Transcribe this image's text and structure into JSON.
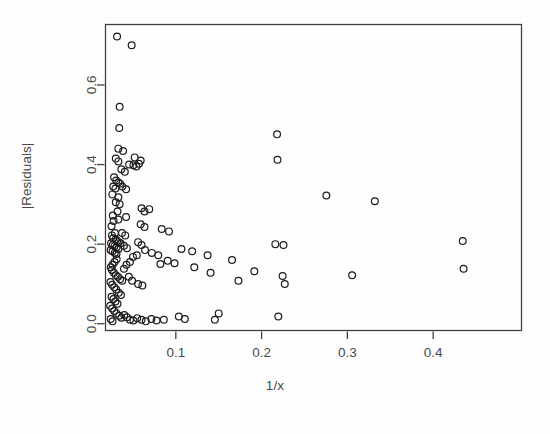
{
  "chart_data": {
    "type": "scatter",
    "title": "",
    "xlabel": "1/x",
    "ylabel": "|Residuals|",
    "xlim": [
      0.018,
      0.503
    ],
    "ylim": [
      -0.017,
      0.752
    ],
    "xticks": [
      0.1,
      0.2,
      0.3,
      0.4
    ],
    "xticklabels": [
      "0.1",
      "0.2",
      "0.3",
      "0.4"
    ],
    "yticks": [
      0.0,
      0.2,
      0.4,
      0.6
    ],
    "yticklabels": [
      "0.0",
      "0.2",
      "0.4",
      "0.6"
    ],
    "grid": false,
    "legend": null,
    "marker": {
      "shape": "open-circle",
      "radius_px": 3.4,
      "stroke": "#1c1c1c",
      "stroke_width": 1.2,
      "fill": "none"
    },
    "frame": {
      "box": true,
      "color": "#3c3c3c"
    },
    "points": [
      [
        0.0315,
        0.722
      ],
      [
        0.0485,
        0.7
      ],
      [
        0.0345,
        0.545
      ],
      [
        0.034,
        0.492
      ],
      [
        0.033,
        0.44
      ],
      [
        0.0385,
        0.434
      ],
      [
        0.03,
        0.415
      ],
      [
        0.033,
        0.408
      ],
      [
        0.052,
        0.418
      ],
      [
        0.059,
        0.41
      ],
      [
        0.0455,
        0.4
      ],
      [
        0.0505,
        0.398
      ],
      [
        0.054,
        0.395
      ],
      [
        0.057,
        0.402
      ],
      [
        0.0365,
        0.388
      ],
      [
        0.0405,
        0.382
      ],
      [
        0.028,
        0.368
      ],
      [
        0.0305,
        0.36
      ],
      [
        0.033,
        0.355
      ],
      [
        0.035,
        0.352
      ],
      [
        0.027,
        0.345
      ],
      [
        0.0295,
        0.34
      ],
      [
        0.0375,
        0.345
      ],
      [
        0.042,
        0.338
      ],
      [
        0.026,
        0.325
      ],
      [
        0.033,
        0.318
      ],
      [
        0.03,
        0.305
      ],
      [
        0.0345,
        0.3
      ],
      [
        0.032,
        0.282
      ],
      [
        0.0265,
        0.272
      ],
      [
        0.06,
        0.29
      ],
      [
        0.0635,
        0.282
      ],
      [
        0.069,
        0.288
      ],
      [
        0.0275,
        0.258
      ],
      [
        0.025,
        0.245
      ],
      [
        0.059,
        0.25
      ],
      [
        0.0635,
        0.243
      ],
      [
        0.0835,
        0.238
      ],
      [
        0.092,
        0.232
      ],
      [
        0.029,
        0.228
      ],
      [
        0.0255,
        0.222
      ],
      [
        0.027,
        0.215
      ],
      [
        0.03,
        0.212
      ],
      [
        0.0315,
        0.208
      ],
      [
        0.0335,
        0.205
      ],
      [
        0.0245,
        0.202
      ],
      [
        0.0265,
        0.198
      ],
      [
        0.0285,
        0.195
      ],
      [
        0.031,
        0.192
      ],
      [
        0.033,
        0.188
      ],
      [
        0.024,
        0.185
      ],
      [
        0.0262,
        0.182
      ],
      [
        0.0288,
        0.178
      ],
      [
        0.0308,
        0.175
      ],
      [
        0.0355,
        0.202
      ],
      [
        0.0395,
        0.196
      ],
      [
        0.043,
        0.19
      ],
      [
        0.056,
        0.205
      ],
      [
        0.06,
        0.198
      ],
      [
        0.064,
        0.185
      ],
      [
        0.0545,
        0.172
      ],
      [
        0.05,
        0.168
      ],
      [
        0.072,
        0.178
      ],
      [
        0.0795,
        0.172
      ],
      [
        0.1065,
        0.188
      ],
      [
        0.119,
        0.182
      ],
      [
        0.137,
        0.172
      ],
      [
        0.1655,
        0.16
      ],
      [
        0.216,
        0.2
      ],
      [
        0.2255,
        0.198
      ],
      [
        0.218,
        0.476
      ],
      [
        0.2185,
        0.412
      ],
      [
        0.2755,
        0.322
      ],
      [
        0.332,
        0.308
      ],
      [
        0.4345,
        0.208
      ],
      [
        0.4355,
        0.138
      ],
      [
        0.3055,
        0.122
      ],
      [
        0.2245,
        0.12
      ],
      [
        0.227,
        0.1
      ],
      [
        0.1915,
        0.132
      ],
      [
        0.173,
        0.108
      ],
      [
        0.1405,
        0.128
      ],
      [
        0.1215,
        0.142
      ],
      [
        0.0985,
        0.152
      ],
      [
        0.0905,
        0.158
      ],
      [
        0.082,
        0.15
      ],
      [
        0.031,
        0.162
      ],
      [
        0.0285,
        0.155
      ],
      [
        0.0262,
        0.148
      ],
      [
        0.0242,
        0.142
      ],
      [
        0.0255,
        0.135
      ],
      [
        0.0278,
        0.128
      ],
      [
        0.03,
        0.122
      ],
      [
        0.0325,
        0.118
      ],
      [
        0.035,
        0.112
      ],
      [
        0.0375,
        0.108
      ],
      [
        0.0238,
        0.105
      ],
      [
        0.0258,
        0.098
      ],
      [
        0.0282,
        0.092
      ],
      [
        0.0305,
        0.086
      ],
      [
        0.0452,
        0.118
      ],
      [
        0.049,
        0.108
      ],
      [
        0.056,
        0.1
      ],
      [
        0.061,
        0.096
      ],
      [
        0.0335,
        0.078
      ],
      [
        0.036,
        0.072
      ],
      [
        0.025,
        0.068
      ],
      [
        0.0272,
        0.062
      ],
      [
        0.0295,
        0.056
      ],
      [
        0.032,
        0.05
      ],
      [
        0.0235,
        0.045
      ],
      [
        0.0258,
        0.038
      ],
      [
        0.0282,
        0.032
      ],
      [
        0.0308,
        0.026
      ],
      [
        0.034,
        0.02
      ],
      [
        0.0365,
        0.015
      ],
      [
        0.0398,
        0.022
      ],
      [
        0.043,
        0.016
      ],
      [
        0.0465,
        0.01
      ],
      [
        0.0505,
        0.008
      ],
      [
        0.055,
        0.014
      ],
      [
        0.06,
        0.01
      ],
      [
        0.065,
        0.006
      ],
      [
        0.0715,
        0.012
      ],
      [
        0.0775,
        0.008
      ],
      [
        0.086,
        0.01
      ],
      [
        0.024,
        0.012
      ],
      [
        0.0262,
        0.006
      ],
      [
        0.1035,
        0.018
      ],
      [
        0.1105,
        0.012
      ],
      [
        0.1455,
        0.01
      ],
      [
        0.15,
        0.026
      ],
      [
        0.2195,
        0.018
      ],
      [
        0.0425,
        0.148
      ],
      [
        0.0395,
        0.138
      ],
      [
        0.0465,
        0.155
      ],
      [
        0.033,
        0.262
      ],
      [
        0.042,
        0.268
      ],
      [
        0.0372,
        0.228
      ],
      [
        0.041,
        0.222
      ]
    ]
  }
}
